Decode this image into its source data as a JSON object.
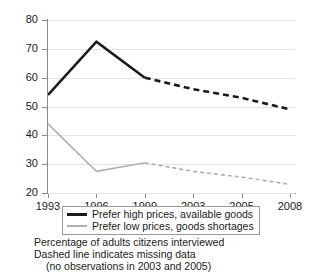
{
  "chart_data": {
    "type": "line",
    "title": "",
    "xlabel": "",
    "ylabel": "",
    "categories": [
      "1993",
      "1996",
      "1999",
      "2003",
      "2005",
      "2008"
    ],
    "ylim": [
      20,
      80
    ],
    "yticks": [
      20,
      30,
      40,
      50,
      60,
      70,
      80
    ],
    "grid": true,
    "legend_position": "below-axes",
    "series": [
      {
        "name": "Prefer high prices, available goods",
        "color": "#1a1a1a",
        "values": [
          54,
          72.5,
          60,
          56,
          53,
          49
        ],
        "solid_through_index": 2,
        "dashed_from_index": 2
      },
      {
        "name": "Prefer low prices, goods shortages",
        "color": "#b0b0b0",
        "values": [
          44,
          27.5,
          30.5,
          27.5,
          25.5,
          23
        ],
        "solid_through_index": 2,
        "dashed_from_index": 2
      }
    ],
    "annotations": [
      "Percentage of adults citizens interviewed",
      "Dashed line indicates missing data",
      "(no observations in 2003 and 2005)"
    ]
  },
  "axis": {
    "y_tick_labels": [
      "80",
      "70",
      "60",
      "50",
      "40",
      "30",
      "20"
    ],
    "x_tick_labels": [
      "1993",
      "1996",
      "1999",
      "2003",
      "2005",
      "2008"
    ]
  },
  "legend": {
    "items": [
      {
        "label": "Prefer high prices, available goods"
      },
      {
        "label": "Prefer low prices, goods shortages"
      }
    ]
  },
  "caption": {
    "line1": "Percentage of adults citizens interviewed",
    "line2": "Dashed line indicates missing data",
    "line3": "(no observations in 2003 and 2005)"
  },
  "colors": {
    "series_high": "#1a1a1a",
    "series_low": "#b0b0b0",
    "grid": "#e3e3e3",
    "axis": "#8a8a8a",
    "background": "#ffffff"
  }
}
